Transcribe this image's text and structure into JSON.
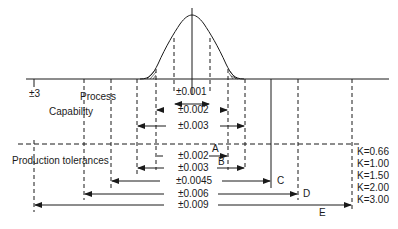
{
  "figure": {
    "labels": {
      "sigma": "±3",
      "process": "Process",
      "capability": "Capability",
      "production_tolerances": "Production tolerances"
    },
    "process_capability": [
      {
        "id": "pc1",
        "value": "±0.001"
      },
      {
        "id": "pc2",
        "value": "±0.002"
      },
      {
        "id": "pc3",
        "value": "±0.003"
      }
    ],
    "production_tolerances": [
      {
        "id": "A",
        "value": "±0.002",
        "letter": "A",
        "k": "K=0.66"
      },
      {
        "id": "B",
        "value": "±0.003",
        "letter": "B",
        "k": "K=1.00"
      },
      {
        "id": "C",
        "value": "±0.0045",
        "letter": "C",
        "k": "K=1.50"
      },
      {
        "id": "D",
        "value": "±0.006",
        "letter": "D",
        "k": "K=2.00"
      },
      {
        "id": "E",
        "value": "±0.009",
        "letter": "E",
        "k": "K=3.00"
      }
    ],
    "colors": {
      "line": "#1a1a1a",
      "background": "#ffffff"
    }
  }
}
